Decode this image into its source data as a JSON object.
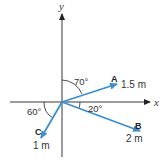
{
  "diagram": {
    "type": "vector-diagram",
    "axes": {
      "x_label": "x",
      "y_label": "y"
    },
    "vectors": [
      {
        "name": "A",
        "magnitude": "1.5 m",
        "angle_label": "70°",
        "angle_reference": "from +y axis toward +x"
      },
      {
        "name": "B",
        "magnitude": "2 m",
        "angle_label": "20°",
        "angle_reference": "below +x axis"
      },
      {
        "name": "C",
        "magnitude": "1 m",
        "angle_label": "60°",
        "angle_reference": "from -x axis, below"
      }
    ],
    "colors": {
      "vector": "#3a8fd0",
      "axis": "#222222"
    }
  }
}
